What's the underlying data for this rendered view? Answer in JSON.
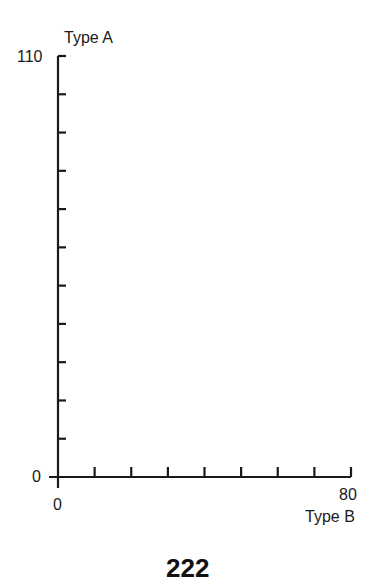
{
  "chart_data": {
    "type": "scatter",
    "title": "",
    "xlabel": "Type B",
    "ylabel": "Type A",
    "xlim": [
      0,
      80
    ],
    "ylim": [
      0,
      110
    ],
    "x_ticks": [
      0,
      10,
      20,
      30,
      40,
      50,
      60,
      70,
      80
    ],
    "y_ticks": [
      0,
      10,
      20,
      30,
      40,
      50,
      60,
      70,
      80,
      90,
      100,
      110
    ],
    "x_tick_labels": [
      "0",
      "80"
    ],
    "y_tick_labels": [
      "0",
      "110"
    ],
    "grid": false,
    "legend": null,
    "series": []
  },
  "axes": {
    "y_label": "Type A",
    "x_label": "Type B",
    "y_max_label": "110",
    "y_min_label": "0",
    "x_min_label": "0",
    "x_max_label": "80"
  },
  "page_number": "222"
}
